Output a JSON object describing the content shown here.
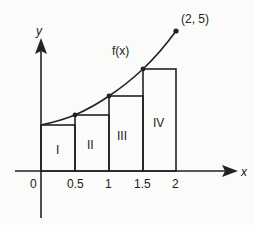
{
  "diagram": {
    "type": "left-riemann-sum",
    "function_label": "f(x)",
    "endpoint_label": "(2, 5)",
    "axes": {
      "x_label": "x",
      "y_label": "y",
      "x_ticks": [
        "0",
        "0.5",
        "1",
        "1.5",
        "2"
      ]
    },
    "rectangles": [
      {
        "label": "I",
        "x_from": 0,
        "x_to": 0.5
      },
      {
        "label": "II",
        "x_from": 0.5,
        "x_to": 1
      },
      {
        "label": "III",
        "x_from": 1,
        "x_to": 1.5
      },
      {
        "label": "IV",
        "x_from": 1.5,
        "x_to": 2
      }
    ],
    "colors": {
      "stroke": "#222222",
      "background": "#fbfbf9"
    }
  }
}
